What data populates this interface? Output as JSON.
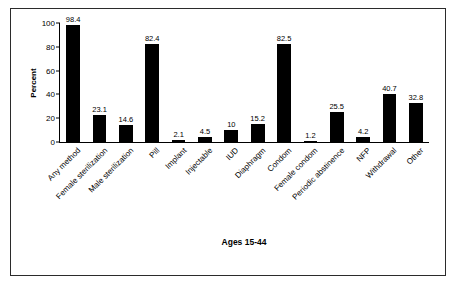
{
  "chart_data": {
    "type": "bar",
    "title": "",
    "xlabel": "Ages 15-44",
    "ylabel": "Percent",
    "ylim": [
      0,
      100
    ],
    "yticks": [
      0,
      20,
      40,
      60,
      80,
      100
    ],
    "grid": false,
    "legend": "none",
    "bar_color": "#000000",
    "categories": [
      "Any method",
      "Female sterilization",
      "Male sterilization",
      "Pill",
      "Implant",
      "Injectable",
      "IUD",
      "Diaphragm",
      "Condom",
      "Female condom",
      "Periodic abstinence",
      "NFP",
      "Withdrawal",
      "Other"
    ],
    "values": [
      98.4,
      23.1,
      14.6,
      82.4,
      2.1,
      4.5,
      10,
      15.2,
      82.5,
      1.2,
      25.5,
      4.2,
      40.7,
      32.8
    ],
    "value_labels": [
      "98.4",
      "23.1",
      "14.6",
      "82.4",
      "2.1",
      "4.5",
      "10",
      "15.2",
      "82.5",
      "1.2",
      "25.5",
      "4.2",
      "40.7",
      "32.8"
    ]
  }
}
